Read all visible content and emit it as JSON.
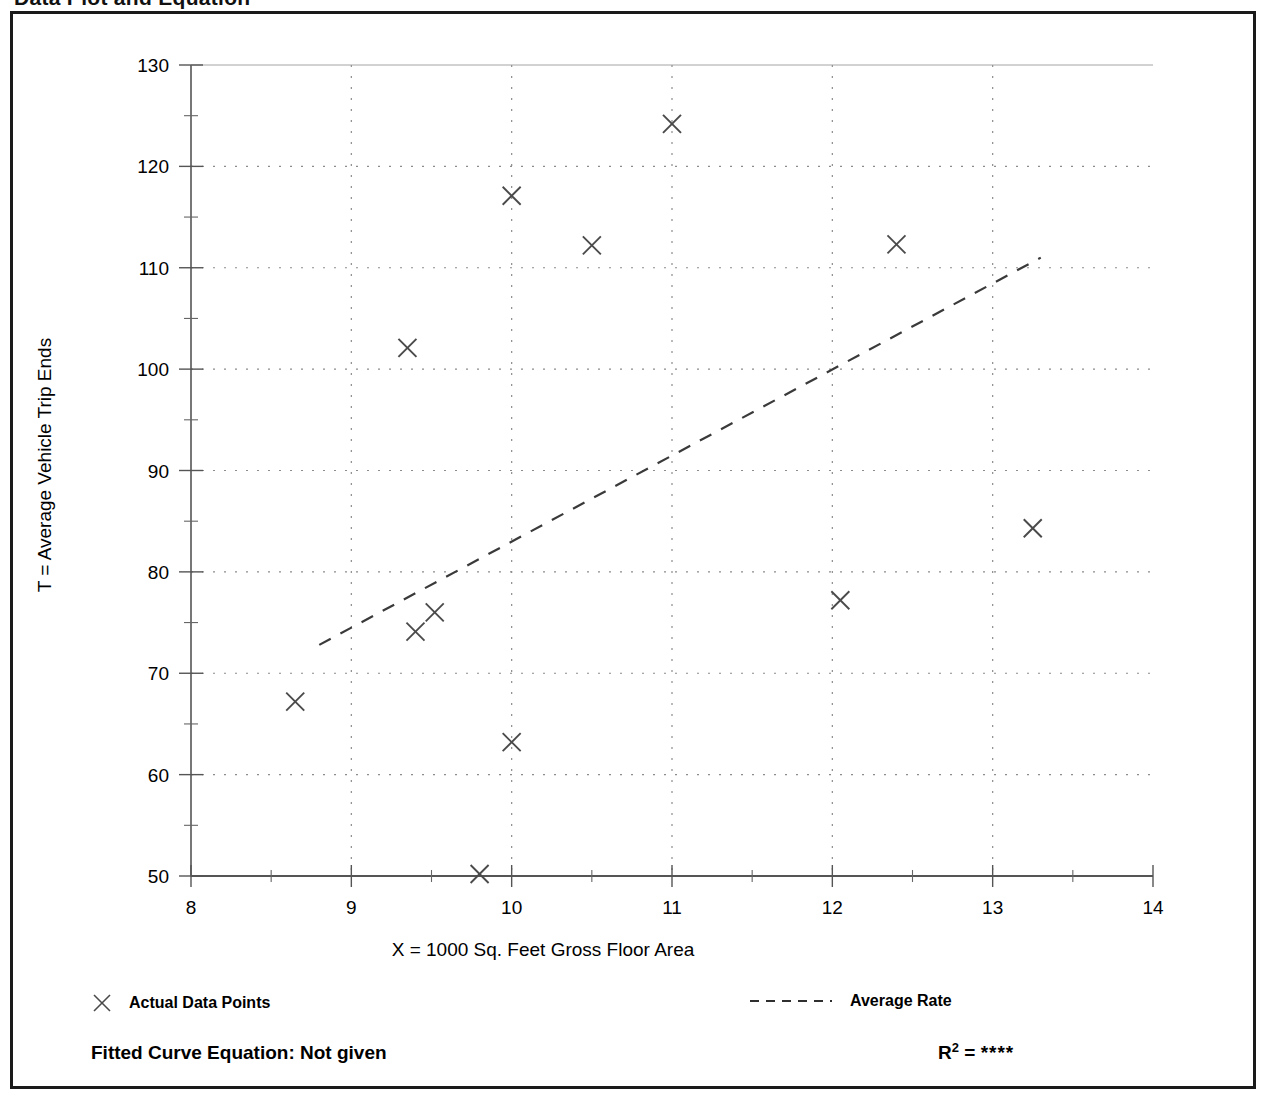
{
  "page": {
    "title": "Data Plot and Equation"
  },
  "footer": {
    "equation_label": "Fitted Curve Equation:  Not given",
    "r2_label": "R",
    "r2_exponent": "2",
    "r2_equals": " = ",
    "r2_value": "****"
  },
  "legend": {
    "points_label": "Actual Data Points",
    "line_label": "Average Rate",
    "point_marker_icon": "x-marker-icon",
    "line_marker_icon": "dashed-line-icon"
  },
  "chart_data": {
    "type": "scatter",
    "title": "",
    "xlabel": "X = 1000 Sq. Feet Gross Floor Area",
    "ylabel": "T = Average Vehicle Trip Ends",
    "xlim": [
      8,
      14
    ],
    "ylim": [
      50,
      130
    ],
    "xticks": [
      8,
      9,
      10,
      11,
      12,
      13,
      14
    ],
    "yticks": [
      50,
      60,
      70,
      80,
      90,
      100,
      110,
      120,
      130
    ],
    "xticklabels": [
      "8",
      "9",
      "10",
      "11",
      "12",
      "13",
      "14"
    ],
    "yticklabels": [
      "50",
      "60",
      "70",
      "80",
      "90",
      "100",
      "110",
      "120",
      "130"
    ],
    "x_minor_step": 0.5,
    "y_minor_step": 5,
    "grid": true,
    "grid_style": "dotted",
    "legend_position": "below-axes",
    "series": [
      {
        "name": "Actual Data Points",
        "type": "scatter",
        "marker": "x",
        "color": "#4a4a4a",
        "points": [
          {
            "x": 8.65,
            "y": 67.2
          },
          {
            "x": 9.35,
            "y": 102.1
          },
          {
            "x": 9.4,
            "y": 74.1
          },
          {
            "x": 9.52,
            "y": 76.0
          },
          {
            "x": 9.8,
            "y": 50.2
          },
          {
            "x": 10.0,
            "y": 117.1
          },
          {
            "x": 10.0,
            "y": 63.2
          },
          {
            "x": 10.5,
            "y": 112.2
          },
          {
            "x": 11.0,
            "y": 124.2
          },
          {
            "x": 12.05,
            "y": 77.2
          },
          {
            "x": 12.4,
            "y": 112.3
          },
          {
            "x": 13.25,
            "y": 84.3
          }
        ]
      },
      {
        "name": "Average Rate",
        "type": "line",
        "style": "dashed",
        "color": "#3a3a3a",
        "endpoints": [
          {
            "x": 8.8,
            "y": 72.8
          },
          {
            "x": 13.3,
            "y": 111.0
          }
        ]
      }
    ]
  }
}
